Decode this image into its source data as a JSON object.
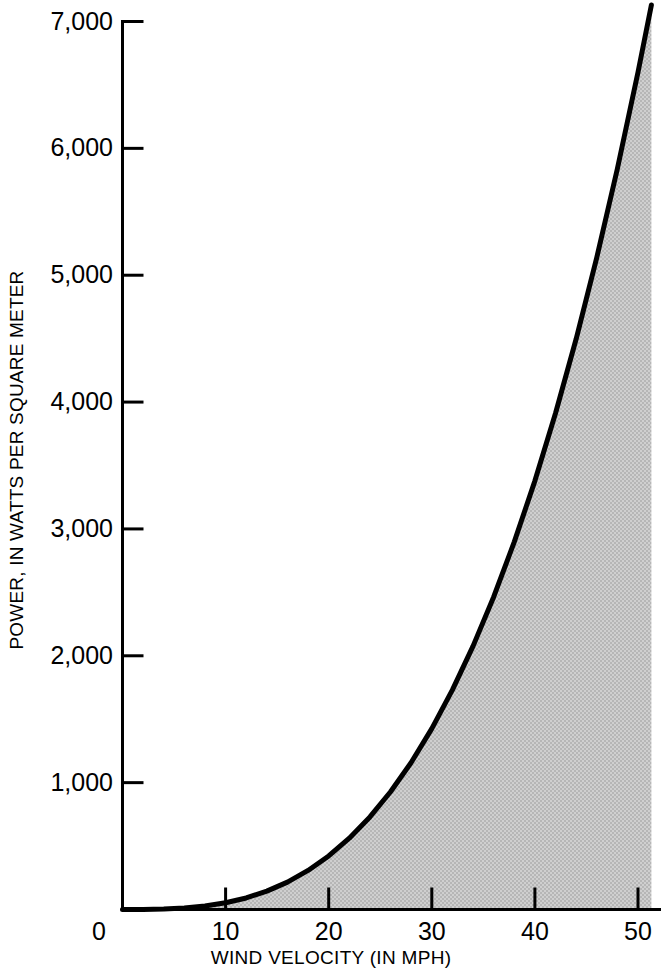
{
  "chart_data": {
    "type": "area",
    "title": "",
    "subtitle": "",
    "xlabel": "WIND VELOCITY (IN MPH)",
    "ylabel": "POWER, IN WATTS PER SQUARE METER",
    "xlim": [
      0,
      51.3
    ],
    "ylim": [
      0,
      7000
    ],
    "grid": false,
    "legend": "none",
    "xticks": [
      0,
      10,
      20,
      30,
      40,
      50
    ],
    "xtick_labels": [
      "0",
      "10",
      "20",
      "30",
      "40",
      "50"
    ],
    "yticks": [
      0,
      1000,
      2000,
      3000,
      4000,
      5000,
      6000,
      7000
    ],
    "ytick_labels": [
      "0",
      "1,000",
      "2,000",
      "3,000",
      "4,000",
      "5,000",
      "6,000",
      "7,000"
    ],
    "curve_color": "#000000",
    "fill_color": "#c4c4c4",
    "axis_color": "#000000",
    "relation": "P = k * v^3",
    "k": 0.0528,
    "series": [
      {
        "name": "Wind power density",
        "x": [
          0,
          2,
          4,
          6,
          8,
          10,
          12,
          14,
          16,
          18,
          20,
          22,
          24,
          26,
          28,
          30,
          32,
          34,
          36,
          38,
          40,
          42,
          44,
          46,
          48,
          50,
          51.3
        ],
        "values": [
          0,
          0,
          3,
          11,
          27,
          53,
          91,
          145,
          216,
          308,
          422,
          562,
          730,
          928,
          1159,
          1426,
          1731,
          2076,
          2464,
          2898,
          3379,
          3912,
          4497,
          5139,
          5839,
          6600,
          7130
        ]
      }
    ],
    "annotations": []
  },
  "axis": {
    "y_axis_name": "power-axis",
    "x_axis_name": "velocity-axis"
  }
}
